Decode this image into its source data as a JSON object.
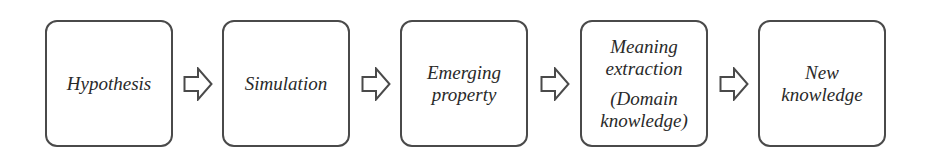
{
  "diagram": {
    "title": "",
    "direction": "left-to-right",
    "colors": {
      "stroke": "#4a4a4a",
      "text": "#2a2a2a",
      "fill": "#ffffff"
    },
    "steps": [
      {
        "id": "hypothesis",
        "lines": [
          "Hypothesis"
        ]
      },
      {
        "id": "simulation",
        "lines": [
          "Simulation"
        ]
      },
      {
        "id": "emerging-property",
        "lines": [
          "Emerging",
          "property"
        ]
      },
      {
        "id": "meaning-extraction",
        "lines": [
          "Meaning",
          "extraction",
          "(Domain",
          "knowledge)"
        ]
      },
      {
        "id": "new-knowledge",
        "lines": [
          "New",
          "knowledge"
        ]
      }
    ],
    "arrows": [
      {
        "from": "hypothesis",
        "to": "simulation",
        "icon": "block-arrow-right-icon"
      },
      {
        "from": "simulation",
        "to": "emerging-property",
        "icon": "block-arrow-right-icon"
      },
      {
        "from": "emerging-property",
        "to": "meaning-extraction",
        "icon": "block-arrow-right-icon"
      },
      {
        "from": "meaning-extraction",
        "to": "new-knowledge",
        "icon": "block-arrow-right-icon"
      }
    ]
  }
}
